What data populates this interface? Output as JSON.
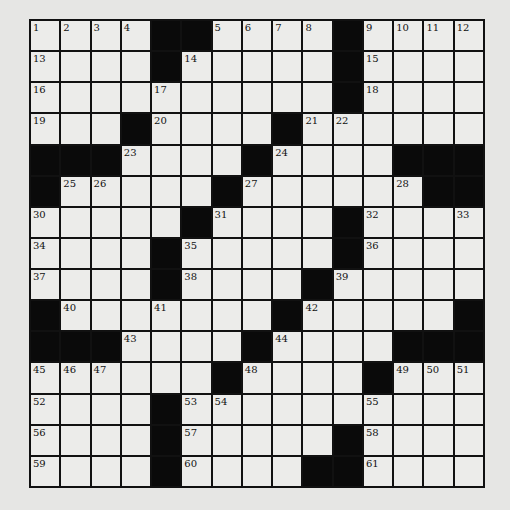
{
  "puzzle": {
    "rows": 15,
    "cols": 15,
    "layout": [
      "....##....#....",
      "....#.....#....",
      "..........#....",
      "...#....#......",
      "###....#....###",
      "#.....#......##",
      ".....#....#....",
      "....#.....#....",
      "....#....#.....",
      "#.......#.....#",
      "###....#....###",
      "......#....#...",
      "....#..........",
      "....#.....#....",
      "....#....##...."
    ],
    "numbers": [
      {
        "r": 0,
        "c": 0,
        "n": "1"
      },
      {
        "r": 0,
        "c": 1,
        "n": "2"
      },
      {
        "r": 0,
        "c": 2,
        "n": "3"
      },
      {
        "r": 0,
        "c": 3,
        "n": "4"
      },
      {
        "r": 0,
        "c": 6,
        "n": "5"
      },
      {
        "r": 0,
        "c": 7,
        "n": "6"
      },
      {
        "r": 0,
        "c": 8,
        "n": "7"
      },
      {
        "r": 0,
        "c": 9,
        "n": "8"
      },
      {
        "r": 0,
        "c": 11,
        "n": "9"
      },
      {
        "r": 0,
        "c": 12,
        "n": "10"
      },
      {
        "r": 0,
        "c": 13,
        "n": "11"
      },
      {
        "r": 0,
        "c": 14,
        "n": "12"
      },
      {
        "r": 1,
        "c": 0,
        "n": "13"
      },
      {
        "r": 1,
        "c": 5,
        "n": "14"
      },
      {
        "r": 1,
        "c": 11,
        "n": "15"
      },
      {
        "r": 2,
        "c": 0,
        "n": "16"
      },
      {
        "r": 2,
        "c": 4,
        "n": "17"
      },
      {
        "r": 2,
        "c": 11,
        "n": "18"
      },
      {
        "r": 3,
        "c": 0,
        "n": "19"
      },
      {
        "r": 3,
        "c": 4,
        "n": "20"
      },
      {
        "r": 3,
        "c": 9,
        "n": "21"
      },
      {
        "r": 3,
        "c": 10,
        "n": "22"
      },
      {
        "r": 4,
        "c": 3,
        "n": "23"
      },
      {
        "r": 4,
        "c": 8,
        "n": "24"
      },
      {
        "r": 5,
        "c": 1,
        "n": "25"
      },
      {
        "r": 5,
        "c": 2,
        "n": "26"
      },
      {
        "r": 5,
        "c": 7,
        "n": "27"
      },
      {
        "r": 5,
        "c": 12,
        "n": "28"
      },
      {
        "r": 5,
        "c": 13,
        "n": "29"
      },
      {
        "r": 6,
        "c": 0,
        "n": "30"
      },
      {
        "r": 6,
        "c": 6,
        "n": "31"
      },
      {
        "r": 6,
        "c": 11,
        "n": "32"
      },
      {
        "r": 6,
        "c": 14,
        "n": "33"
      },
      {
        "r": 7,
        "c": 0,
        "n": "34"
      },
      {
        "r": 7,
        "c": 5,
        "n": "35"
      },
      {
        "r": 7,
        "c": 11,
        "n": "36"
      },
      {
        "r": 8,
        "c": 0,
        "n": "37"
      },
      {
        "r": 8,
        "c": 5,
        "n": "38"
      },
      {
        "r": 8,
        "c": 10,
        "n": "39"
      },
      {
        "r": 9,
        "c": 1,
        "n": "40"
      },
      {
        "r": 9,
        "c": 4,
        "n": "41"
      },
      {
        "r": 9,
        "c": 9,
        "n": "42"
      },
      {
        "r": 10,
        "c": 3,
        "n": "43"
      },
      {
        "r": 10,
        "c": 8,
        "n": "44"
      },
      {
        "r": 11,
        "c": 0,
        "n": "45"
      },
      {
        "r": 11,
        "c": 1,
        "n": "46"
      },
      {
        "r": 11,
        "c": 2,
        "n": "47"
      },
      {
        "r": 11,
        "c": 7,
        "n": "48"
      },
      {
        "r": 11,
        "c": 12,
        "n": "49"
      },
      {
        "r": 11,
        "c": 13,
        "n": "50"
      },
      {
        "r": 11,
        "c": 14,
        "n": "51"
      },
      {
        "r": 12,
        "c": 0,
        "n": "52"
      },
      {
        "r": 12,
        "c": 5,
        "n": "53"
      },
      {
        "r": 12,
        "c": 6,
        "n": "54"
      },
      {
        "r": 12,
        "c": 11,
        "n": "55"
      },
      {
        "r": 13,
        "c": 0,
        "n": "56"
      },
      {
        "r": 13,
        "c": 5,
        "n": "57"
      },
      {
        "r": 13,
        "c": 11,
        "n": "58"
      },
      {
        "r": 14,
        "c": 0,
        "n": "59"
      },
      {
        "r": 14,
        "c": 5,
        "n": "60"
      },
      {
        "r": 14,
        "c": 11,
        "n": "61"
      }
    ]
  },
  "colors": {
    "background": "#e6e6e4",
    "cell": "#ececea",
    "block": "#0a0a0a",
    "line": "#111111"
  }
}
